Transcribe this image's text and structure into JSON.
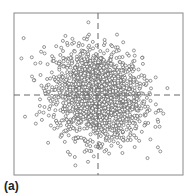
{
  "chart_data": {
    "type": "scatter",
    "title": "",
    "panel_label": "(a)",
    "xlabel": "",
    "ylabel": "",
    "grid": false,
    "legend": null,
    "x_range": [
      -4,
      4
    ],
    "y_range": [
      -4,
      4
    ],
    "n_points": 2000,
    "distribution": {
      "mean_x": 0,
      "mean_y": 0,
      "sd_x": 1,
      "sd_y": 1,
      "correlation": -0.15
    },
    "crosshair": {
      "x": 0,
      "y": 0,
      "style": "dashed"
    },
    "marker": {
      "shape": "open-circle",
      "color": "#555555"
    }
  },
  "layout": {
    "box": {
      "left": 14,
      "top": 13,
      "right": 183,
      "bottom": 175
    },
    "center_px": {
      "x": 98,
      "y": 95
    },
    "scale_px_per_unit": 22
  }
}
